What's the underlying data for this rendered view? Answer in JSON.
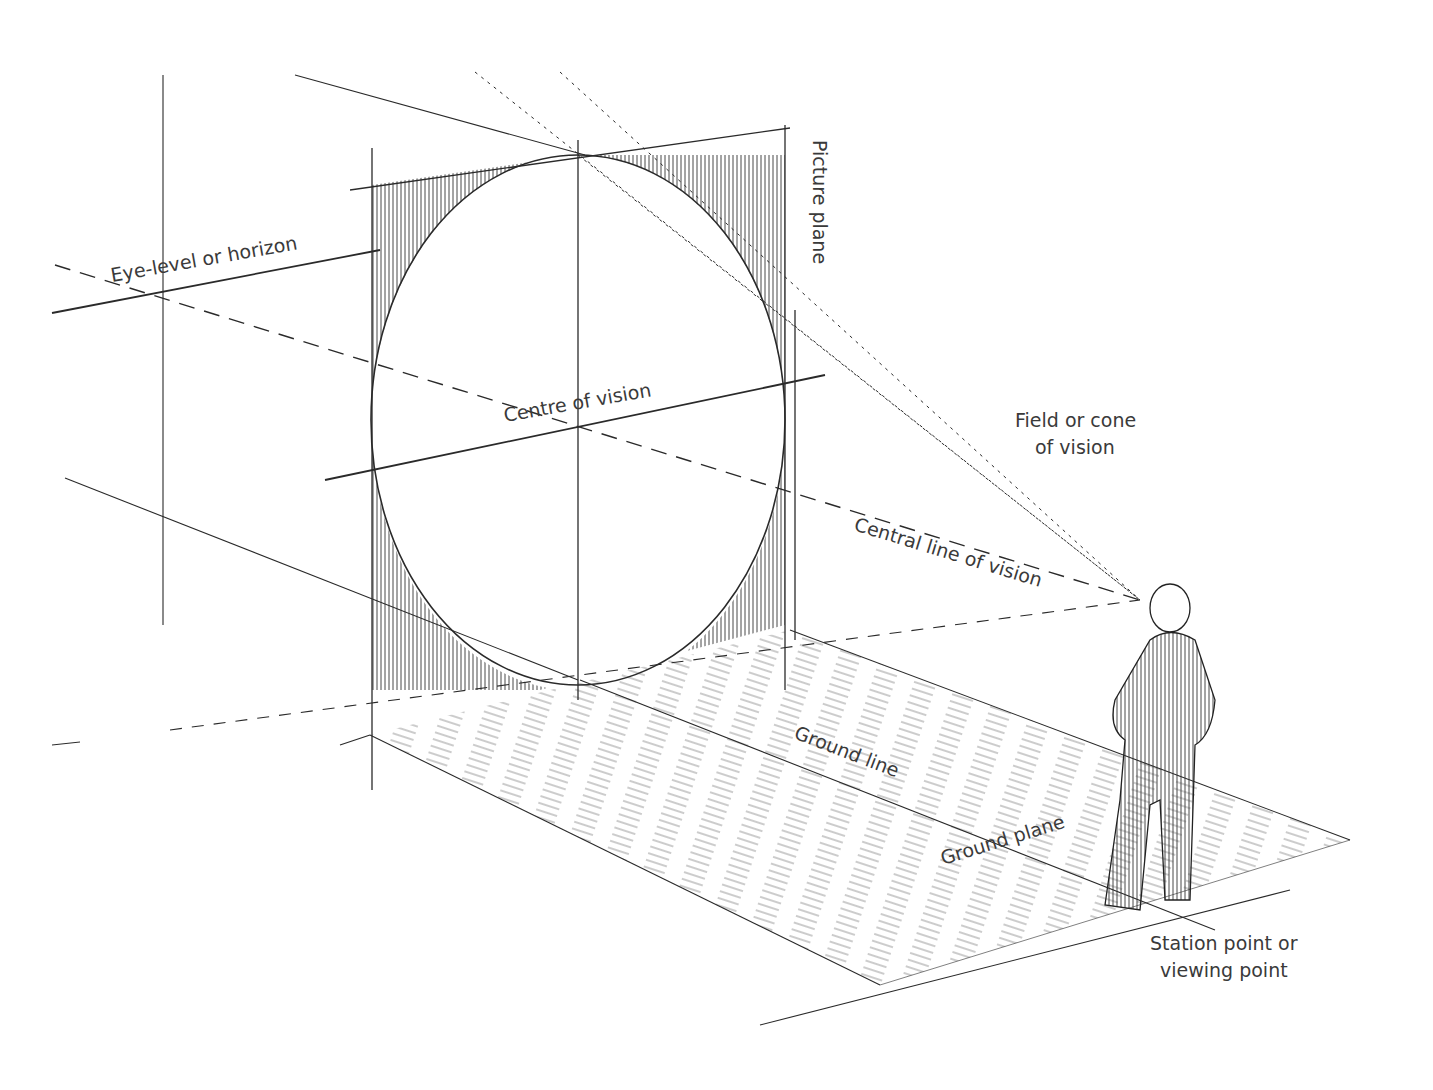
{
  "diagram": {
    "type": "perspective-drawing-illustration",
    "labels": {
      "eye_level": "Eye-level or horizon",
      "picture_plane": "Picture plane",
      "centre_of_vision": "Centre of vision",
      "field_of_vision_line1": "Field or cone",
      "field_of_vision_line2": "of vision",
      "central_line_of_vision": "Central line of vision",
      "ground_line": "Ground line",
      "ground_plane": "Ground plane",
      "station_point_line1": "Station point or",
      "station_point_line2": "viewing point"
    },
    "colors": {
      "ink": "#2a2a2a",
      "text": "#3a3a3a",
      "background": "#ffffff"
    }
  }
}
